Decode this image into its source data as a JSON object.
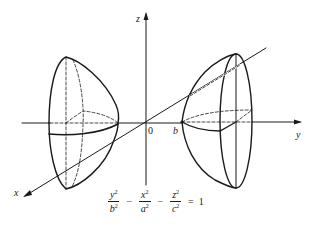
{
  "figure": {
    "type": "hyperboloid of two sheets",
    "axes": {
      "x_label": "x",
      "y_label": "y",
      "z_label": "z",
      "origin_label": "0",
      "vertex_label": "b"
    },
    "equation": {
      "terms": [
        {
          "num": "y",
          "num_exp": "2",
          "den": "b",
          "den_exp": "2"
        },
        {
          "op": "−"
        },
        {
          "num": "x",
          "num_exp": "2",
          "den": "a",
          "den_exp": "2"
        },
        {
          "op": "−"
        },
        {
          "num": "z",
          "num_exp": "2",
          "den": "c",
          "den_exp": "2"
        }
      ],
      "equals": "=",
      "rhs": "1"
    },
    "colors": {
      "line": "#1a1a1a",
      "background": "#ffffff"
    }
  }
}
